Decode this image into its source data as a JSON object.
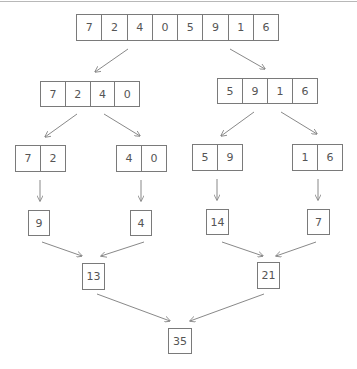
{
  "diagram": {
    "title": "",
    "style": {
      "stroke": "#7a7a7a",
      "text": "#555555",
      "topline": "#b8b8b8"
    },
    "level0": {
      "values": [
        "7",
        "2",
        "4",
        "0",
        "5",
        "9",
        "1",
        "6"
      ]
    },
    "level1": [
      {
        "values": [
          "7",
          "2",
          "4",
          "0"
        ]
      },
      {
        "values": [
          "5",
          "9",
          "1",
          "6"
        ]
      }
    ],
    "level2": [
      {
        "values": [
          "7",
          "2"
        ]
      },
      {
        "values": [
          "4",
          "0"
        ]
      },
      {
        "values": [
          "5",
          "9"
        ]
      },
      {
        "values": [
          "1",
          "6"
        ]
      }
    ],
    "level3": [
      {
        "value": "9"
      },
      {
        "value": "4"
      },
      {
        "value": "14"
      },
      {
        "value": "7"
      }
    ],
    "level4": [
      {
        "value": "13"
      },
      {
        "value": "21"
      }
    ],
    "level5": {
      "value": "35"
    }
  }
}
